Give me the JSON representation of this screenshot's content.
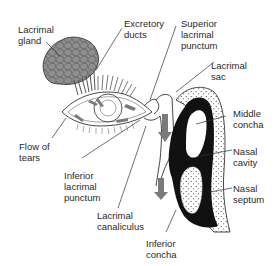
{
  "diagram": {
    "type": "anatomical-illustration",
    "labels": {
      "lacrimal_gland": "Lacrimal\ngland",
      "excretory_ducts": "Excretory\nducts",
      "superior_lacrimal_punctum": "Superior\nlacrimal\npunctum",
      "lacrimal_sac": "Lacrimal\nsac",
      "middle_concha": "Middle\nconcha",
      "flow_of_tears": "Flow of\ntears",
      "nasal_cavity": "Nasal\ncavity",
      "inferior_lacrimal_punctum": "Inferior\nlacrimal\npunctum",
      "nasal_septum": "Nasal\nseptum",
      "lacrimal_canaliculus": "Lacrimal\ncanaliculus",
      "inferior_concha": "Inferior\nconcha"
    },
    "colors": {
      "line": "#333333",
      "gland_fill": "#8a8a8a",
      "arrow_fill": "#7a7a7a",
      "concha_fill": "#111111",
      "background": "#ffffff"
    }
  }
}
